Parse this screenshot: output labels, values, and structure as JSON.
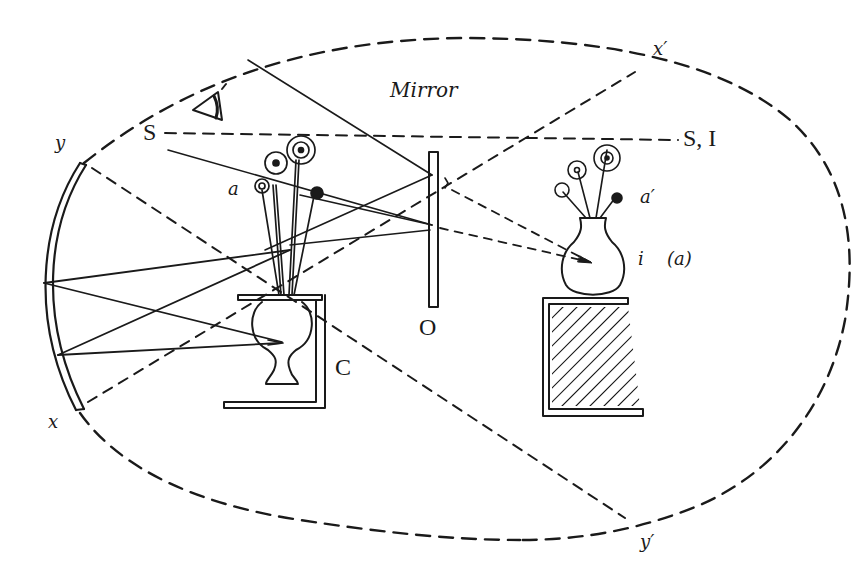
{
  "diagram": {
    "colors": {
      "ink": "#1a1a1a",
      "background": "#ffffff"
    },
    "labels": {
      "mirror": "Mirror",
      "source": "S",
      "source_image": "S, I",
      "object": "a",
      "image": "a′",
      "image_point": "i",
      "figure_tag": "(a)",
      "mirror_pole": "O",
      "centre": "C",
      "x": "x",
      "x_prime": "x′",
      "y": "y",
      "y_prime": "y′"
    },
    "components": [
      "concave-mirror",
      "plane-mirror",
      "box-with-inverted-vase",
      "real-flowers",
      "image-vase-with-flowers",
      "hatched-stand",
      "eye",
      "dashed-field-ellipse"
    ]
  }
}
